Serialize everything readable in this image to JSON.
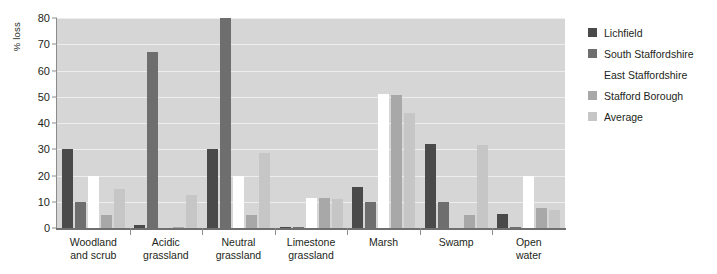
{
  "chart_data": {
    "type": "bar",
    "title": "",
    "xlabel": "",
    "ylabel": "% loss",
    "ylim": [
      0,
      80
    ],
    "yticks": [
      0,
      10,
      20,
      30,
      40,
      50,
      60,
      70,
      80
    ],
    "grid": true,
    "legend_position": "right",
    "categories": [
      "Woodland\nand scrub",
      "Acidic\ngrassland",
      "Neutral\ngrassland",
      "Limestone\ngrassland",
      "Marsh",
      "Swamp",
      "Open\nwater"
    ],
    "category_labels": [
      {
        "line1": "Woodland",
        "line2": "and scrub"
      },
      {
        "line1": "Acidic",
        "line2": "grassland"
      },
      {
        "line1": "Neutral",
        "line2": "grassland"
      },
      {
        "line1": "Limestone",
        "line2": "grassland"
      },
      {
        "line1": "Marsh",
        "line2": ""
      },
      {
        "line1": "Swamp",
        "line2": ""
      },
      {
        "line1": "Open",
        "line2": "water"
      }
    ],
    "series": [
      {
        "name": "Lichfield",
        "color": "#4a4a4a",
        "values": [
          30,
          1,
          30,
          0.5,
          15.5,
          32,
          5.5
        ]
      },
      {
        "name": "South Staffordshire",
        "color": "#6e6e6e",
        "values": [
          10,
          67,
          80,
          0.3,
          10,
          10,
          0.5
        ]
      },
      {
        "name": "East Staffordshire",
        "color": "#ffffff",
        "values": [
          20,
          0,
          20,
          11.5,
          51,
          0,
          20
        ]
      },
      {
        "name": "Stafford Borough",
        "color": "#a8a8a8",
        "values": [
          5,
          0.3,
          5,
          11.5,
          50.5,
          5,
          7.5
        ]
      },
      {
        "name": "Average",
        "color": "#c6c6c6",
        "values": [
          15,
          12.5,
          28.5,
          11,
          44,
          31.5,
          7
        ]
      }
    ]
  },
  "legend": {
    "items": [
      {
        "label": "Lichfield",
        "color": "#4a4a4a"
      },
      {
        "label": "South Staffordshire",
        "color": "#6e6e6e"
      },
      {
        "label": "East Staffordshire",
        "color": "#ffffff"
      },
      {
        "label": "Stafford Borough",
        "color": "#a8a8a8"
      },
      {
        "label": "Average",
        "color": "#c6c6c6"
      }
    ]
  }
}
